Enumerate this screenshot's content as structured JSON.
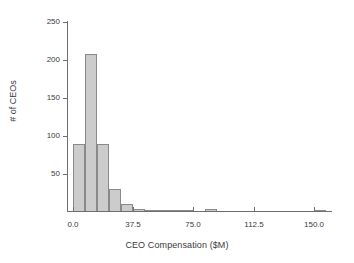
{
  "chart_data": {
    "type": "bar",
    "title": "",
    "xlabel": "CEO Compensation ($M)",
    "ylabel": "# of CEOs",
    "xlim": [
      -3.0,
      160.0
    ],
    "ylim": [
      0,
      250
    ],
    "grid": false,
    "legend": null,
    "bin_width": 7.5,
    "xticks": [
      "0.0",
      "37.5",
      "75.0",
      "112.5",
      "150.0"
    ],
    "xtick_values": [
      0.0,
      37.5,
      75.0,
      112.5,
      150.0
    ],
    "yticks": [
      "50",
      "100",
      "150",
      "200",
      "250"
    ],
    "ytick_values": [
      50,
      100,
      150,
      200,
      250
    ],
    "categories": [
      "0.0-7.5",
      "7.5-15.0",
      "15.0-22.5",
      "22.5-30.0",
      "30.0-37.5",
      "37.5-45.0",
      "45.0-52.5",
      "52.5-60.0",
      "60.0-67.5",
      "67.5-75.0",
      "75.0-82.5",
      "82.5-90.0",
      "90.0-97.5",
      "97.5-105.0",
      "105.0-112.5",
      "112.5-120.0",
      "120.0-127.5",
      "127.5-135.0",
      "135.0-142.5",
      "142.5-150.0",
      "150.0-157.5"
    ],
    "bin_starts": [
      0.0,
      7.5,
      15.0,
      22.5,
      30.0,
      37.5,
      45.0,
      52.5,
      60.0,
      67.5,
      75.0,
      82.5,
      90.0,
      97.5,
      105.0,
      112.5,
      120.0,
      127.5,
      135.0,
      142.5,
      150.0
    ],
    "values": [
      89,
      208,
      89,
      30,
      11,
      4,
      2,
      2,
      3,
      3,
      0,
      4,
      0,
      0,
      0,
      0,
      0,
      0,
      0,
      0,
      3
    ]
  },
  "style": {
    "bar_fill": "#cccccc",
    "bar_edge": "#8a8a8a",
    "axis_color": "#6e6e6e",
    "text_color": "#3a3a3a",
    "background": "#ffffff"
  }
}
